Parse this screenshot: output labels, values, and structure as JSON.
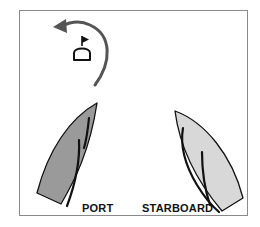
{
  "diagram": {
    "type": "sailing-right-of-way",
    "labels": {
      "port": "PORT",
      "starboard": "STARBOARD"
    },
    "elements": {
      "mark": {
        "icon": "buoy-with-flag-icon"
      },
      "rounding_arrow": {
        "icon": "curved-arrow-counterclockwise-icon",
        "direction": "counterclockwise"
      },
      "port_boat": {
        "tack": "port",
        "fill": "#9a9a9a"
      },
      "starboard_boat": {
        "tack": "starboard",
        "fill": "#d8d8d8"
      }
    },
    "colors": {
      "frame": "#8a8a8a",
      "arrow": "#555555",
      "outline": "#111111",
      "sail": "#111111",
      "background": "#ffffff"
    }
  }
}
